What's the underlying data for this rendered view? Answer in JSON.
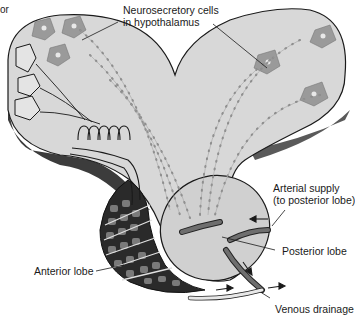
{
  "figure": {
    "cropped_text": "or",
    "labels": {
      "neurosecretory_line1": "Neurosecretory cells",
      "neurosecretory_line2": "in hypothalamus",
      "arterial_line1": "Arterial supply",
      "arterial_line2": "(to posterior lobe)",
      "posterior_lobe": "Posterior lobe",
      "anterior_lobe": "Anterior lobe",
      "venous_drainage": "Venous drainage"
    },
    "colors": {
      "tissue": "#d6d6d6",
      "tissue_shadow": "#4a4a4a",
      "cell_body": "#9a9a9a",
      "outline": "#1a1a1a",
      "vessel": "#6e6e6e",
      "background": "#ffffff"
    }
  }
}
